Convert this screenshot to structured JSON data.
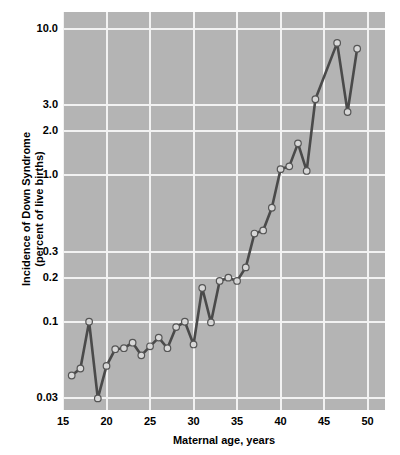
{
  "chart_data": {
    "type": "line",
    "title": "",
    "xlabel": "Maternal age, years",
    "ylabel_line1": "Incidence of Down Syndrome",
    "ylabel_line2": "(percent of live births)",
    "yscale": "log",
    "xlim": [
      15.0,
      52.0
    ],
    "ylim": [
      0.025,
      13.0
    ],
    "grid": true,
    "legend": "none",
    "xticks": [
      15,
      20,
      25,
      30,
      35,
      40,
      45,
      50
    ],
    "xtick_labels": [
      "15",
      "20",
      "25",
      "30",
      "35",
      "40",
      "45",
      "50"
    ],
    "yticks": [
      0.03,
      0.1,
      0.2,
      0.3,
      1.0,
      2.0,
      3.0,
      10.0
    ],
    "ytick_labels": [
      "0.03",
      "0.1",
      "0.2",
      "0.3",
      "1.0",
      "2.0",
      "3.0",
      "10.0"
    ],
    "series": [
      {
        "name": "Incidence of Down Syndrome",
        "x": [
          16,
          17,
          18,
          19,
          20,
          21,
          22,
          23,
          24,
          25,
          26,
          27,
          28,
          29,
          30,
          31,
          32,
          33,
          34,
          35,
          36,
          37,
          38,
          39,
          40,
          41,
          42,
          43,
          44,
          46.5,
          47.7,
          48.8
        ],
        "values": [
          0.043,
          0.048,
          0.1,
          0.03,
          0.05,
          0.065,
          0.066,
          0.072,
          0.059,
          0.068,
          0.078,
          0.066,
          0.092,
          0.1,
          0.07,
          0.17,
          0.099,
          0.19,
          0.2,
          0.19,
          0.235,
          0.4,
          0.42,
          0.6,
          1.1,
          1.15,
          1.65,
          1.07,
          3.3,
          8.0,
          2.7,
          7.3
        ]
      }
    ],
    "line_color": "#4a4a4a",
    "marker_fill": "#d8d8d8",
    "marker_edge": "#555555",
    "panel_bg": "#b4b4b4",
    "grid_color": "#f2f2f2"
  },
  "figure": {
    "background": "#ffffff"
  }
}
